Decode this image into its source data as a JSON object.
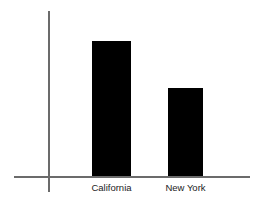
{
  "chart_data": {
    "type": "bar",
    "title": "",
    "subtitle": "",
    "xlabel": "",
    "ylabel": "",
    "categories": [
      "California",
      "New York"
    ],
    "values": [
      100,
      65
    ],
    "series": [
      {
        "name": "",
        "values": [
          100,
          65
        ]
      }
    ],
    "ylim": [
      0,
      122
    ],
    "grid": false,
    "legend": false,
    "legend_position": "none",
    "tick_labels_x": [
      "California",
      "New York"
    ],
    "tick_labels_y": [],
    "annotations": []
  },
  "style": {
    "background_color": "#ffffff",
    "bar_color": "#000000",
    "axis_color": "#6b6b6b",
    "label_color": "#1c1c1c"
  }
}
